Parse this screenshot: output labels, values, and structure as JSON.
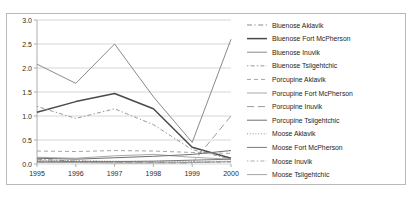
{
  "chart_data": {
    "type": "line",
    "title": "",
    "xlabel": "",
    "ylabel": "",
    "x": [
      1995,
      1996,
      1997,
      1998,
      1999,
      2000
    ],
    "xticklabels": [
      "1995",
      "1996",
      "1997",
      "1998",
      "1999",
      "2000"
    ],
    "yticklabels": [
      "0.0",
      "0.5",
      "1.0",
      "1.5",
      "2.0",
      "2.5",
      "3.0"
    ],
    "yticks": [
      0.0,
      0.5,
      1.0,
      1.5,
      2.0,
      2.5,
      3.0
    ],
    "ylim": [
      0.0,
      3.0
    ],
    "grid": "horizontal",
    "legend_position": "right",
    "series": [
      {
        "name": "Bluenose Aklavik",
        "values": [
          0.1,
          0.06,
          0.05,
          0.04,
          0.03,
          0.05
        ],
        "style": "dash-dot",
        "color": "#7d7d7d",
        "width": 0.9
      },
      {
        "name": "Bluenose Fort McPherson",
        "values": [
          1.08,
          1.3,
          1.47,
          1.15,
          0.35,
          0.12
        ],
        "style": "solid",
        "color": "#4a4a4a",
        "width": 1.5
      },
      {
        "name": "Bluenose Inuvik",
        "values": [
          2.08,
          1.68,
          2.5,
          1.4,
          0.45,
          2.6
        ],
        "style": "solid",
        "color": "#8a8a8a",
        "width": 1.0
      },
      {
        "name": "Bluenose Tsiigehtchic",
        "values": [
          1.2,
          0.95,
          1.15,
          0.82,
          0.3,
          0.1
        ],
        "style": "dotted-dash",
        "color": "#8c8c8c",
        "width": 0.9
      },
      {
        "name": "Porcupine Aklavik",
        "values": [
          0.27,
          0.26,
          0.28,
          0.27,
          0.24,
          0.22
        ],
        "style": "dashed",
        "color": "#9a9a9a",
        "width": 0.9
      },
      {
        "name": "Porcupine Fort McPherson",
        "values": [
          0.14,
          0.12,
          0.17,
          0.2,
          0.14,
          0.1
        ],
        "style": "solid",
        "color": "#9e9e9e",
        "width": 0.9
      },
      {
        "name": "Porcupine Inuvik",
        "values": [
          0.05,
          0.04,
          0.04,
          0.03,
          0.02,
          1.0
        ],
        "style": "long-dash",
        "color": "#8f8f8f",
        "width": 0.9
      },
      {
        "name": "Porcupine Tsiigehtchic",
        "values": [
          0.12,
          0.1,
          0.13,
          0.16,
          0.2,
          0.28
        ],
        "style": "solid",
        "color": "#6f6f6f",
        "width": 1.0
      },
      {
        "name": "Moose Aklavik",
        "values": [
          0.08,
          0.07,
          0.06,
          0.05,
          0.05,
          0.06
        ],
        "style": "fine-dotted",
        "color": "#8a8a8a",
        "width": 0.9
      },
      {
        "name": "Moose Fort McPherson",
        "values": [
          0.06,
          0.05,
          0.05,
          0.06,
          0.08,
          0.1
        ],
        "style": "solid",
        "color": "#7a7a7a",
        "width": 1.0
      },
      {
        "name": "Moose Inuvik",
        "values": [
          0.04,
          0.03,
          0.03,
          0.03,
          0.04,
          0.04
        ],
        "style": "dotted-dash",
        "color": "#a0a0a0",
        "width": 0.9
      },
      {
        "name": "Moose Tsiigehtchic",
        "values": [
          0.03,
          0.03,
          0.02,
          0.02,
          0.03,
          0.05
        ],
        "style": "solid",
        "color": "#9a9a9a",
        "width": 0.9
      }
    ]
  },
  "frame": {
    "border_color": "#b9b9b9",
    "background": "#ffffff"
  }
}
